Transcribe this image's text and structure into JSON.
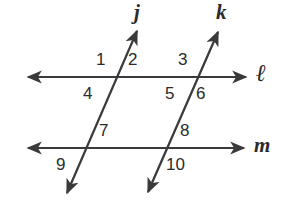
{
  "figure": {
    "type": "geometry-diagram",
    "background_color": "#ffffff",
    "stroke_color": "#3a3a3a",
    "label_color": "#2b2b2b",
    "canvas": {
      "width": 293,
      "height": 208
    },
    "lines": [
      {
        "name": "j",
        "label": "j",
        "role": "transversal",
        "arrows": "both",
        "from": {
          "x": 67,
          "y": 193
        },
        "to": {
          "x": 137,
          "y": 31
        },
        "label_position": {
          "x": 134,
          "y": 2
        }
      },
      {
        "name": "k",
        "label": "k",
        "role": "transversal",
        "arrows": "both",
        "from": {
          "x": 148,
          "y": 192
        },
        "to": {
          "x": 218,
          "y": 32
        },
        "label_position": {
          "x": 216,
          "y": 2
        }
      },
      {
        "name": "l",
        "label": "ℓ",
        "role": "parallel-line",
        "arrows": "both",
        "from": {
          "x": 28,
          "y": 77
        },
        "to": {
          "x": 246,
          "y": 77
        },
        "label_position": {
          "x": 256,
          "y": 63
        }
      },
      {
        "name": "m",
        "label": "m",
        "role": "parallel-line",
        "arrows": "both",
        "from": {
          "x": 28,
          "y": 148
        },
        "to": {
          "x": 244,
          "y": 148
        },
        "label_position": {
          "x": 254,
          "y": 136
        }
      }
    ],
    "intersections": [
      {
        "id": "j-l",
        "x": 115,
        "y": 77
      },
      {
        "id": "k-l",
        "x": 196,
        "y": 77
      },
      {
        "id": "j-m",
        "x": 85,
        "y": 148
      },
      {
        "id": "k-m",
        "x": 166,
        "y": 148
      }
    ],
    "angle_labels": [
      {
        "id": "angle-1",
        "text": "1",
        "x": 96,
        "y": 51,
        "at": "j-l",
        "quadrant": "upper-left"
      },
      {
        "id": "angle-2",
        "text": "2",
        "x": 128,
        "y": 51,
        "at": "j-l",
        "quadrant": "upper-right"
      },
      {
        "id": "angle-3",
        "text": "3",
        "x": 178,
        "y": 51,
        "at": "k-l",
        "quadrant": "upper-left"
      },
      {
        "id": "angle-4",
        "text": "4",
        "x": 83,
        "y": 85,
        "at": "j-l",
        "quadrant": "lower-left"
      },
      {
        "id": "angle-5",
        "text": "5",
        "x": 165,
        "y": 85,
        "at": "k-l",
        "quadrant": "lower-left"
      },
      {
        "id": "angle-6",
        "text": "6",
        "x": 196,
        "y": 85,
        "at": "k-l",
        "quadrant": "lower-right"
      },
      {
        "id": "angle-7",
        "text": "7",
        "x": 99,
        "y": 122,
        "at": "j-m",
        "quadrant": "upper-right"
      },
      {
        "id": "angle-8",
        "text": "8",
        "x": 180,
        "y": 122,
        "at": "k-m",
        "quadrant": "upper-right"
      },
      {
        "id": "angle-9",
        "text": "9",
        "x": 56,
        "y": 156,
        "at": "j-m",
        "quadrant": "lower-left"
      },
      {
        "id": "angle-10",
        "text": "10",
        "x": 166,
        "y": 156,
        "at": "k-m",
        "quadrant": "lower-right"
      }
    ]
  }
}
